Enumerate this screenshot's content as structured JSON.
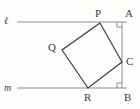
{
  "figure": {
    "canvas": {
      "width": 140,
      "height": 109
    },
    "colors": {
      "background": "#fdfdfc",
      "stroke_square": "#3b3b3b",
      "stroke_line": "#8c8c8c",
      "stroke_vertical": "#8c8c8c",
      "label": "#3a3a3a",
      "right_angle": "#8c8c8c"
    },
    "lines": [
      {
        "name": "line-l",
        "label": "ℓ",
        "x1": 17,
        "y1": 22,
        "x2": 127,
        "y2": 22
      },
      {
        "name": "line-m",
        "label": "m",
        "x1": 17,
        "y1": 88,
        "x2": 127,
        "y2": 88
      },
      {
        "name": "segment-ab",
        "label": "",
        "x1": 122,
        "y1": 22,
        "x2": 122,
        "y2": 88
      }
    ],
    "points": [
      {
        "name": "P",
        "label": "P",
        "x": 100,
        "y": 23,
        "label_x": 95,
        "label_y": 8
      },
      {
        "name": "Q",
        "label": "Q",
        "x": 62,
        "y": 50,
        "label_x": 48,
        "label_y": 42
      },
      {
        "name": "R",
        "label": "R",
        "x": 88,
        "y": 88,
        "label_x": 84,
        "label_y": 92
      },
      {
        "name": "C",
        "label": "C",
        "x": 122,
        "y": 62,
        "label_x": 126,
        "label_y": 56
      },
      {
        "name": "A",
        "label": "A",
        "x": 122,
        "y": 22,
        "label_x": 125,
        "label_y": 8
      },
      {
        "name": "B",
        "label": "B",
        "x": 122,
        "y": 88,
        "label_x": 124,
        "label_y": 92
      }
    ],
    "square": {
      "name": "square-PQRC",
      "vertices": "100,23 62,50 88,88 122,62",
      "vertex_order": [
        "P",
        "Q",
        "R",
        "C"
      ]
    },
    "right_angles": [
      {
        "name": "right-angle-A",
        "at": "A",
        "path": "M 117,22 L 117,27 L 122,27"
      },
      {
        "name": "right-angle-B",
        "at": "B",
        "path": "M 117,88 L 117,83 L 122,83"
      }
    ]
  }
}
